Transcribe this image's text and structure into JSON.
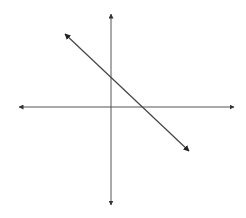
{
  "diagram": {
    "type": "cartesian-line-graph",
    "colors": {
      "background": "#ffffff",
      "axis": "#555555",
      "line": "#444444"
    },
    "axes": {
      "x_axis": {
        "y": 107,
        "x_start": 19,
        "x_end": 234,
        "arrows": "both",
        "labels": []
      },
      "y_axis": {
        "x": 111,
        "y_start": 14,
        "y_end": 205,
        "arrows": "both",
        "labels": []
      },
      "origin_px": [
        111,
        107
      ]
    },
    "line": {
      "start_px": [
        65,
        34
      ],
      "end_px": [
        189,
        151
      ],
      "arrows": "both",
      "slope_sign": "negative",
      "y_intercept_px": [
        111,
        77
      ],
      "x_intercept_px": [
        143,
        107
      ]
    }
  }
}
